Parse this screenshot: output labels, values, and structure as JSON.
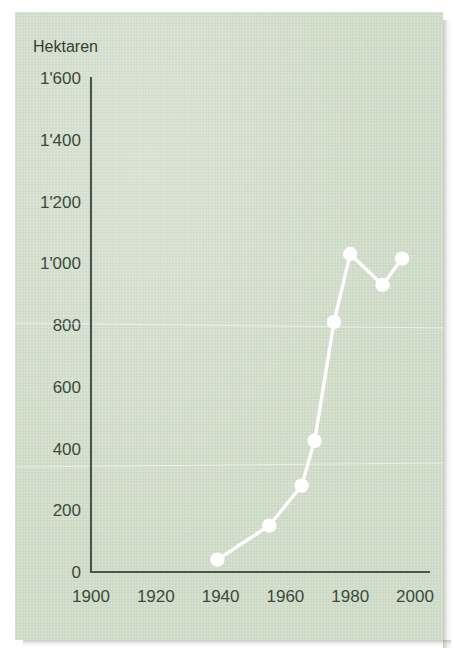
{
  "figure": {
    "background_color": "#ccd9c4",
    "series_color": "#ffffff",
    "axis_color": "#4a554a",
    "text_color": "#3d4a3d"
  },
  "chart_data": {
    "type": "line",
    "title": "",
    "subtitle": "",
    "unit_label": "Hektaren",
    "xlabel": "",
    "ylabel": "Hektaren",
    "xlim": [
      1900,
      2005
    ],
    "ylim": [
      0,
      1600
    ],
    "grid": false,
    "legend": null,
    "x_ticks": [
      1900,
      1920,
      1940,
      1960,
      1980,
      2000
    ],
    "x_tick_labels": [
      "1900",
      "1920",
      "1940",
      "1960",
      "1980",
      "2000"
    ],
    "y_ticks": [
      0,
      200,
      400,
      600,
      800,
      1000,
      1200,
      1400,
      1600
    ],
    "y_tick_labels": [
      "0",
      "200",
      "400",
      "600",
      "800",
      "1'000",
      "1'200",
      "1'400",
      "1'600"
    ],
    "marker": "circle",
    "x": [
      1939,
      1955,
      1965,
      1969,
      1975,
      1980,
      1990,
      1996
    ],
    "values": [
      40,
      150,
      280,
      425,
      810,
      1030,
      930,
      1015
    ],
    "points": [
      {
        "x": 1939,
        "y": 40
      },
      {
        "x": 1955,
        "y": 150
      },
      {
        "x": 1965,
        "y": 280
      },
      {
        "x": 1969,
        "y": 425
      },
      {
        "x": 1975,
        "y": 810
      },
      {
        "x": 1980,
        "y": 1030
      },
      {
        "x": 1990,
        "y": 930
      },
      {
        "x": 1996,
        "y": 1015
      }
    ]
  }
}
